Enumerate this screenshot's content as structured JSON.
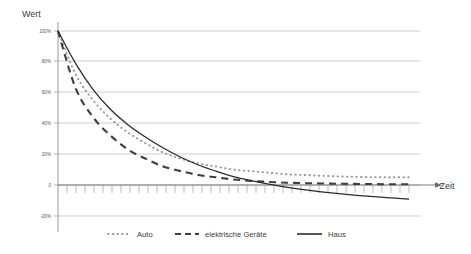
{
  "chart_data": {
    "type": "line",
    "title": "",
    "xlabel": "Zeit",
    "ylabel": "Wert",
    "grid": true,
    "legend_position": "bottom",
    "x": [
      0,
      5,
      10,
      15,
      20,
      25,
      30,
      35,
      40,
      45,
      50,
      55,
      60,
      65,
      70,
      75,
      80,
      85,
      90,
      95,
      100
    ],
    "xlim": [
      0,
      100
    ],
    "ylim": [
      -20,
      100
    ],
    "ytick_labels": [
      "100%",
      "80%",
      "60%",
      "40%",
      "20%",
      "0",
      "-20%"
    ],
    "ytick_values": [
      100,
      80,
      60,
      40,
      20,
      0,
      -20
    ],
    "xtick_labels": [],
    "series": [
      {
        "name": "Auto",
        "style": "dotted",
        "color": "#9a9a9a",
        "values": [
          100,
          72,
          55,
          43,
          34,
          27,
          21,
          17,
          14,
          12,
          10,
          9,
          8,
          7,
          6.5,
          6,
          5.6,
          5.3,
          5.1,
          5,
          5
        ]
      },
      {
        "name": "elektrische Geräte",
        "style": "dashed",
        "color": "#3f3f3f",
        "values": [
          100,
          63,
          44,
          32,
          23,
          17,
          12,
          9,
          6.5,
          5,
          3.6,
          2.7,
          2,
          1.5,
          1.2,
          1,
          0.8,
          0.7,
          0.6,
          0.5,
          0.5
        ]
      },
      {
        "name": "Haus",
        "style": "solid",
        "color": "#2b2b2b",
        "values": [
          100,
          79,
          62,
          49,
          39,
          31,
          24,
          18,
          13,
          9,
          5.5,
          2.8,
          0.5,
          -1.4,
          -3,
          -4.4,
          -5.6,
          -6.7,
          -7.6,
          -8.4,
          -9.2
        ]
      }
    ]
  },
  "axis": {
    "y_title": "Wert",
    "x_title": "Zeit"
  },
  "legend": {
    "items": [
      {
        "label": "Auto",
        "marker": "dotted-line-marker"
      },
      {
        "label": "elektrische Geräte",
        "marker": "dashed-line-marker"
      },
      {
        "label": "Haus",
        "marker": "solid-line-marker"
      }
    ]
  }
}
